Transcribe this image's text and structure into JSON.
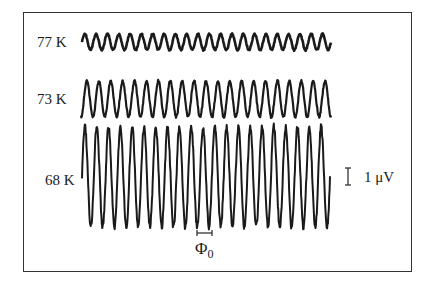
{
  "chart_data": {
    "type": "line",
    "title": "",
    "xlabel": "Φ0 (flux period scale bar)",
    "ylabel": "",
    "grid": false,
    "legend": "none (traces labeled inline at left)",
    "series": [
      {
        "name": "77 K",
        "label": "77 K",
        "cycles": 22,
        "amplitude_uV": 0.45,
        "baseline_y": 42,
        "amp_px": 8,
        "x_start": 82,
        "x_end": 331,
        "stroke_width": 2.6
      },
      {
        "name": "73 K",
        "label": "73 K",
        "cycles": 21,
        "amplitude_uV": 1.05,
        "baseline_y": 99,
        "amp_px": 18,
        "x_start": 81,
        "x_end": 331,
        "stroke_width": 2.2
      },
      {
        "name": "68 K",
        "label": "68 K",
        "cycles": 21,
        "amplitude_uV": 2.9,
        "baseline_y": 177,
        "amp_px": 50,
        "x_start": 82,
        "x_end": 330,
        "stroke_width": 2.0
      }
    ],
    "scale_bars": {
      "voltage": {
        "label": "1 μV",
        "value": 1,
        "unit": "μV",
        "length_px": 17
      },
      "flux": {
        "label": "Φ0",
        "symbol": "Φ",
        "subscript": "0",
        "length_px": 15
      }
    }
  },
  "labels": {
    "t77": "77 K",
    "t73": "73 K",
    "t68": "68 K",
    "voltage_scale": "1 μV",
    "flux_symbol": "Φ",
    "flux_sub": "0"
  }
}
